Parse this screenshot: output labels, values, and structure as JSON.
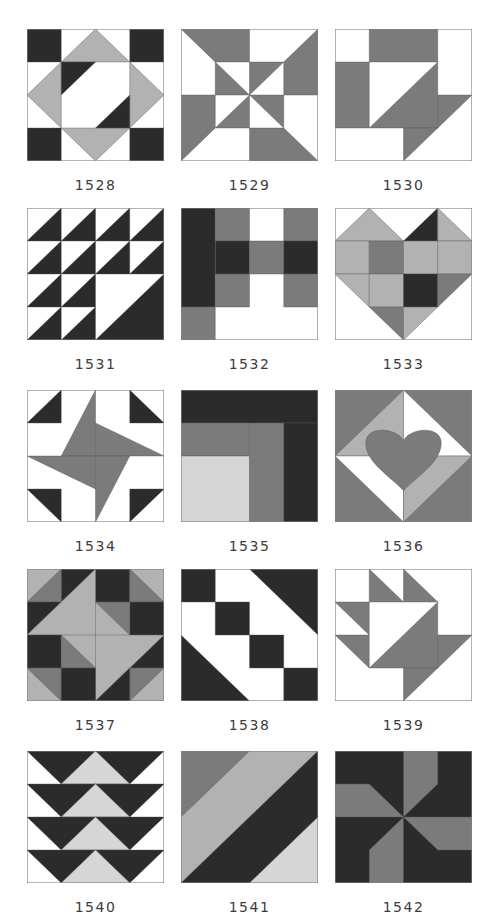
{
  "palette": {
    "W": "#ffffff",
    "D": "#2b2b2b",
    "M": "#7b7b7b",
    "L": "#b2b2b2",
    "V": "#d6d6d6",
    "outline": "#8a8a8a"
  },
  "blocks": [
    {
      "id": "1528",
      "label": "1528",
      "col": 0,
      "row": 0,
      "shapes": [
        [
          "W",
          "0,0 4,0 4,4 0,4"
        ],
        [
          "D",
          "0,0 1,0 1,1 0,1"
        ],
        [
          "D",
          "3,0 4,0 4,1 3,1"
        ],
        [
          "D",
          "0,3 1,3 1,4 0,4"
        ],
        [
          "D",
          "3,3 4,3 4,4 3,4"
        ],
        [
          "L",
          "1,1 2,0 3,1"
        ],
        [
          "L",
          "3,1 4,2 3,3"
        ],
        [
          "L",
          "1,3 2,4 3,3"
        ],
        [
          "L",
          "1,1 0,2 1,3"
        ],
        [
          "D",
          "1,1 2,1 1,2"
        ],
        [
          "D",
          "3,2 3,3 2,3"
        ]
      ]
    },
    {
      "id": "1529",
      "label": "1529",
      "col": 1,
      "row": 0,
      "shapes": [
        [
          "W",
          "0,0 4,0 4,4 0,4"
        ],
        [
          "M",
          "0,0 2,0 2,1 1,1"
        ],
        [
          "M",
          "4,0 4,2 3,2 3,1"
        ],
        [
          "M",
          "4,4 2,4 2,3 3,3"
        ],
        [
          "M",
          "0,4 0,2 1,2 1,3"
        ],
        [
          "M",
          "1,1 2,2 1,2"
        ],
        [
          "M",
          "2,1 3,1 2,2"
        ],
        [
          "M",
          "3,2 3,3 2,2"
        ],
        [
          "M",
          "2,3 1,3 2,2"
        ]
      ]
    },
    {
      "id": "1530",
      "label": "1530",
      "col": 2,
      "row": 0,
      "shapes": [
        [
          "W",
          "0,0 4,0 4,4 0,4"
        ],
        [
          "M",
          "1,0 3,0 3,1 1,1"
        ],
        [
          "M",
          "0,1 1,1 1,3 0,3"
        ],
        [
          "M",
          "3,1 3,3 1,3"
        ],
        [
          "M",
          "3,2 4,2 3,3"
        ],
        [
          "M",
          "2,3 3,3 2,4"
        ]
      ]
    },
    {
      "id": "1531",
      "label": "1531",
      "col": 0,
      "row": 1,
      "shapes": [
        [
          "W",
          "0,0 4,0 4,4 0,4"
        ],
        [
          "D",
          "0,1 1,0 1,1"
        ],
        [
          "D",
          "1,1 2,0 2,1"
        ],
        [
          "D",
          "2,1 3,0 3,1"
        ],
        [
          "D",
          "3,1 4,0 4,1"
        ],
        [
          "D",
          "0,2 1,1 1,2"
        ],
        [
          "D",
          "1,2 2,1 2,2"
        ],
        [
          "D",
          "2,2 3,1 3,2"
        ],
        [
          "D",
          "3,2 4,1 4,2"
        ],
        [
          "D",
          "0,3 1,2 1,3"
        ],
        [
          "D",
          "1,3 2,2 2,3"
        ],
        [
          "D",
          "0,4 1,3 1,4"
        ],
        [
          "D",
          "1,4 2,3 2,4"
        ],
        [
          "D",
          "2,4 4,2 4,4"
        ]
      ]
    },
    {
      "id": "1532",
      "label": "1532",
      "col": 1,
      "row": 1,
      "shapes": [
        [
          "W",
          "0,0 4,0 4,4 0,4"
        ],
        [
          "D",
          "0,0 1,0 1,3 0,3"
        ],
        [
          "M",
          "1,0 2,0 2,1 1,1"
        ],
        [
          "M",
          "3,0 4,0 4,1 3,1"
        ],
        [
          "D",
          "1,1 2,1 2,2 1,2"
        ],
        [
          "M",
          "2,1 3,1 3,2 2,2"
        ],
        [
          "D",
          "3,1 4,1 4,2 3,2"
        ],
        [
          "M",
          "1,2 2,2 2,3 1,3"
        ],
        [
          "M",
          "3,2 4,2 4,3 3,3"
        ],
        [
          "M",
          "0,3 1,3 1,4 0,4"
        ]
      ]
    },
    {
      "id": "1533",
      "label": "1533",
      "col": 2,
      "row": 1,
      "shapes": [
        [
          "W",
          "0,0 4,0 4,4 0,4"
        ],
        [
          "L",
          "0,1 1,0 2,1"
        ],
        [
          "D",
          "2,1 3,0 3,1"
        ],
        [
          "L",
          "3,0 4,1 3,1"
        ],
        [
          "L",
          "0,1 1,1 1,2 0,2"
        ],
        [
          "M",
          "1,1 2,1 2,2 1,2"
        ],
        [
          "L",
          "2,1 3,1 3,2 2,2"
        ],
        [
          "L",
          "3,1 4,1 4,2 3,2"
        ],
        [
          "L",
          "0,2 1,2 1,3"
        ],
        [
          "L",
          "1,2 2,2 2,3 1,3"
        ],
        [
          "D",
          "2,2 3,2 3,3 2,3"
        ],
        [
          "M",
          "3,2 4,2 3,3"
        ],
        [
          "M",
          "1,3 2,3 2,4"
        ],
        [
          "L",
          "2,3 3,3 2,4"
        ]
      ]
    },
    {
      "id": "1534",
      "label": "1534",
      "col": 0,
      "row": 2,
      "shapes": [
        [
          "W",
          "0,0 4,0 4,4 0,4"
        ],
        [
          "D",
          "0,1 1,0 1,1"
        ],
        [
          "D",
          "3,0 4,1 3,1"
        ],
        [
          "D",
          "0,3 1,3 1,4"
        ],
        [
          "D",
          "3,3 4,3 3,4"
        ],
        [
          "M",
          "2,0 2,2 1,2"
        ],
        [
          "M",
          "2,1 4,2 2,2"
        ],
        [
          "M",
          "3,2 2,4 2,2"
        ],
        [
          "M",
          "0,2 2,2 2,3"
        ]
      ]
    },
    {
      "id": "1535",
      "label": "1535",
      "col": 1,
      "row": 2,
      "shapes": [
        [
          "D",
          "0,0 4,0 4,1 0,1"
        ],
        [
          "M",
          "0,1 2,1 2,2 0,2"
        ],
        [
          "V",
          "0,2 2,2 2,4 0,4"
        ],
        [
          "M",
          "2,1 3,1 3,4 2,4"
        ],
        [
          "D",
          "3,1 4,1 4,4 3,4"
        ]
      ]
    },
    {
      "id": "1536",
      "label": "1536",
      "col": 2,
      "row": 2,
      "shapes": [
        [
          "M",
          "0,0 4,0 4,4 0,4"
        ],
        [
          "L",
          "2,0 2,2 0,2"
        ],
        [
          "W",
          "2,0 4,2 2,2"
        ],
        [
          "W",
          "0,2 2,2 2,4"
        ],
        [
          "L",
          "2,2 4,2 2,4"
        ]
      ],
      "heart": {
        "color": "M",
        "path": "M2,1.55 C1.85,1.15 0.9,1.05 0.9,1.6 C0.9,2.2 1.6,2.6 2,3.05 C2.4,2.6 3.1,2.2 3.1,1.6 C3.1,1.05 2.15,1.15 2,1.55 Z"
      }
    },
    {
      "id": "1537",
      "label": "1537",
      "col": 0,
      "row": 3,
      "shapes": [
        [
          "L",
          "0,0 4,0 4,4 0,4"
        ],
        [
          "D",
          "1,0 2,0 1,1"
        ],
        [
          "D",
          "2,0 3,0 3,1 2,1"
        ],
        [
          "M",
          "1,0 1,1 0,1"
        ],
        [
          "M",
          "3,0 4,1 3,1"
        ],
        [
          "D",
          "0,1 1,1 0,2"
        ],
        [
          "D",
          "3,1 4,1 4,2 3,2"
        ],
        [
          "L",
          "2,0 2,2 0,2 1,1"
        ],
        [
          "M",
          "2,1 3,1 3,2"
        ],
        [
          "D",
          "0,2 1,2 1,3 0,3"
        ],
        [
          "D",
          "4,2 4,3 3,3"
        ],
        [
          "M",
          "1,2 2,3 1,3"
        ],
        [
          "L",
          "2,2 4,2 3,3 2,4"
        ],
        [
          "M",
          "0,3 1,3 1,4"
        ],
        [
          "M",
          "3,3 4,3 3,4"
        ],
        [
          "D",
          "1,3 2,3 2,4 1,4"
        ],
        [
          "D",
          "2,4 3,3 3,4"
        ]
      ]
    },
    {
      "id": "1538",
      "label": "1538",
      "col": 1,
      "row": 3,
      "shapes": [
        [
          "W",
          "0,0 4,0 4,4 0,4"
        ],
        [
          "D",
          "0,0 1,0 1,1 0,1"
        ],
        [
          "D",
          "1,1 2,1 2,2 1,2"
        ],
        [
          "D",
          "2,0 4,0 4,2"
        ],
        [
          "D",
          "0,2 2,4 0,4"
        ],
        [
          "D",
          "2,2 3,2 3,3 2,3"
        ],
        [
          "D",
          "3,3 4,3 4,4 3,4"
        ]
      ]
    },
    {
      "id": "1539",
      "label": "1539",
      "col": 2,
      "row": 3,
      "shapes": [
        [
          "W",
          "0,0 4,0 4,4 0,4"
        ],
        [
          "M",
          "1,0 2,1 1,1"
        ],
        [
          "M",
          "2,0 3,1 2,1"
        ],
        [
          "M",
          "0,1 1,1 1,2"
        ],
        [
          "M",
          "0,2 1,2 1,3"
        ],
        [
          "M",
          "3,1 3,3 1,3"
        ],
        [
          "M",
          "3,2 4,2 3,3"
        ],
        [
          "M",
          "2,3 3,3 2,4"
        ]
      ]
    },
    {
      "id": "1540",
      "label": "1540",
      "col": 0,
      "row": 4,
      "shapes": [
        [
          "W",
          "0,0 4,0 4,4 0,4"
        ],
        [
          "D",
          "0,0 2,0 1,1"
        ],
        [
          "D",
          "2,0 4,0 3,1"
        ],
        [
          "V",
          "1,1 2,0 3,1"
        ],
        [
          "D",
          "0,1 2,1 1,2"
        ],
        [
          "D",
          "2,1 4,1 3,2"
        ],
        [
          "V",
          "1,2 2,1 3,2"
        ],
        [
          "D",
          "0,2 2,2 1,3"
        ],
        [
          "D",
          "2,2 4,2 3,3"
        ],
        [
          "V",
          "1,3 2,2 3,3"
        ],
        [
          "D",
          "0,3 2,3 1,4"
        ],
        [
          "D",
          "2,3 4,3 3,4"
        ],
        [
          "V",
          "1,4 2,3 3,4"
        ]
      ]
    },
    {
      "id": "1541",
      "label": "1541",
      "col": 1,
      "row": 4,
      "shapes": [
        [
          "L",
          "0,0 4,0 4,4 0,4"
        ],
        [
          "M",
          "0,0 2,0 0,2"
        ],
        [
          "D",
          "4,0 4,2 2,4 0,4"
        ],
        [
          "V",
          "4,2 4,4 2,4"
        ]
      ]
    },
    {
      "id": "1542",
      "label": "1542",
      "col": 2,
      "row": 4,
      "shapes": [
        [
          "D",
          "0,0 4,0 4,4 0,4"
        ],
        [
          "M",
          "2,0 3,0 3,1 2,2"
        ],
        [
          "M",
          "0,1 1,1 2,2 0,2"
        ],
        [
          "M",
          "2,2 4,2 4,3 3,3"
        ],
        [
          "M",
          "2,2 2,4 1,4 1,3"
        ]
      ]
    }
  ],
  "layout": {
    "col_x": [
      27,
      181,
      335
    ],
    "row_y": [
      29,
      208,
      390,
      569,
      751
    ],
    "label_offset": 148
  }
}
